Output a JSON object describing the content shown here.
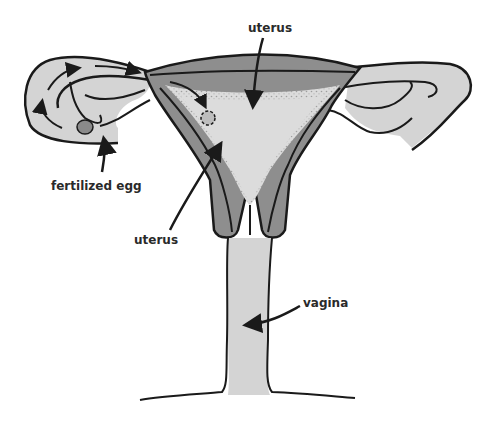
{
  "diagram": {
    "title": "",
    "labels": {
      "uterus_top": "uterus",
      "uterus_left": "uterus",
      "fertilized_egg": "fertilized egg",
      "vagina": "vagina"
    },
    "colors": {
      "background": "#ffffff",
      "outline": "#1a1a1a",
      "light_fill": "#d4d4d4",
      "mid_fill": "#8e8e8e",
      "cavity_fill": "#dcdcdc",
      "egg_fill": "#8a8a8a",
      "label_text": "#2a2a2a"
    }
  }
}
